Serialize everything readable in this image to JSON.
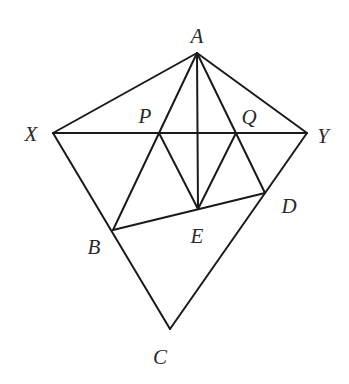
{
  "diagram": {
    "type": "geometry-figure",
    "stroke_color": "#1a1a1a",
    "label_color": "#2a2a2a",
    "points": {
      "A": {
        "label": "A",
        "x": 197,
        "y": 53,
        "label_x": 197,
        "label_y": 36
      },
      "X": {
        "label": "X",
        "x": 53,
        "y": 133,
        "label_x": 31,
        "label_y": 134
      },
      "Y": {
        "label": "Y",
        "x": 307,
        "y": 133,
        "label_x": 323,
        "label_y": 136
      },
      "P": {
        "label": "P",
        "x": 159,
        "y": 133,
        "label_x": 145,
        "label_y": 116
      },
      "Q": {
        "label": "Q",
        "x": 236,
        "y": 133,
        "label_x": 249,
        "label_y": 117
      },
      "E": {
        "label": "E",
        "x": 198,
        "y": 209,
        "label_x": 197,
        "label_y": 236
      },
      "D": {
        "label": "D",
        "x": 265,
        "y": 193,
        "label_x": 289,
        "label_y": 206
      },
      "B": {
        "label": "B",
        "x": 113,
        "y": 230,
        "label_x": 94,
        "label_y": 247
      },
      "C": {
        "label": "C",
        "x": 170,
        "y": 329,
        "label_x": 160,
        "label_y": 357
      }
    },
    "segments": [
      [
        "A",
        "X"
      ],
      [
        "A",
        "Y"
      ],
      [
        "X",
        "Y"
      ],
      [
        "A",
        "E"
      ],
      [
        "A",
        "B"
      ],
      [
        "A",
        "D"
      ],
      [
        "X",
        "C"
      ],
      [
        "Y",
        "C"
      ],
      [
        "B",
        "D"
      ],
      [
        "P",
        "E"
      ],
      [
        "Q",
        "E"
      ]
    ]
  }
}
